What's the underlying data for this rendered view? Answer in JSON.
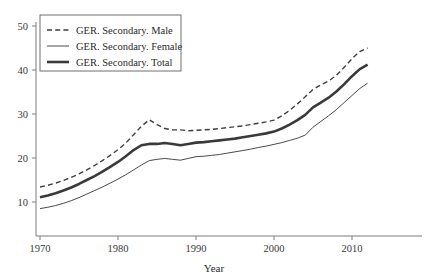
{
  "chart_data": {
    "type": "line",
    "title": "",
    "subtitle": "",
    "xlabel": "Year",
    "ylabel": "",
    "xlim": [
      1970,
      2013
    ],
    "ylim": [
      5,
      52
    ],
    "grid": false,
    "legend_position": "top-left",
    "xticks": [
      1970,
      1980,
      1990,
      2000,
      2010
    ],
    "xtick_labels": [
      "1970",
      "1980",
      "1990",
      "2000",
      "2010"
    ],
    "yticks": [
      10,
      20,
      30,
      40,
      50
    ],
    "ytick_labels": [
      "10",
      "20",
      "30",
      "40",
      "50"
    ],
    "x": [
      1970,
      1971,
      1972,
      1973,
      1974,
      1975,
      1976,
      1977,
      1978,
      1979,
      1980,
      1981,
      1982,
      1983,
      1984,
      1985,
      1986,
      1987,
      1988,
      1989,
      1990,
      1991,
      1992,
      1993,
      1994,
      1995,
      1996,
      1997,
      1998,
      1999,
      2000,
      2001,
      2002,
      2003,
      2004,
      2005,
      2006,
      2007,
      2008,
      2009,
      2010,
      2011,
      2012
    ],
    "series": [
      {
        "name": "GER. Secondary. Male",
        "style": "dashed",
        "color": "#3f3f3f",
        "width": 1.4,
        "values": [
          13.4,
          13.8,
          14.3,
          14.9,
          15.6,
          16.4,
          17.3,
          18.3,
          19.4,
          20.6,
          21.9,
          23.4,
          25.3,
          27.2,
          28.7,
          27.6,
          26.7,
          26.4,
          26.4,
          26.2,
          26.3,
          26.4,
          26.5,
          26.7,
          26.9,
          27.1,
          27.3,
          27.6,
          27.9,
          28.2,
          28.6,
          29.6,
          30.8,
          32.3,
          33.9,
          35.6,
          36.6,
          37.5,
          38.8,
          40.6,
          42.6,
          44.2,
          45.0
        ]
      },
      {
        "name": "GER. Secondary. Female",
        "style": "solid-thin",
        "color": "#4a4a4a",
        "width": 1.0,
        "values": [
          8.5,
          8.8,
          9.2,
          9.7,
          10.3,
          11.0,
          11.8,
          12.6,
          13.4,
          14.3,
          15.2,
          16.2,
          17.3,
          18.4,
          19.4,
          19.7,
          19.9,
          19.7,
          19.5,
          19.9,
          20.3,
          20.4,
          20.6,
          20.8,
          21.1,
          21.4,
          21.7,
          22.0,
          22.4,
          22.7,
          23.1,
          23.5,
          24.0,
          24.5,
          25.2,
          27.0,
          28.3,
          29.6,
          31.0,
          32.6,
          34.2,
          35.8,
          37.0
        ]
      },
      {
        "name": "GER. Secondary. Total",
        "style": "solid-thick",
        "color": "#3a3a3a",
        "width": 2.6,
        "values": [
          11.1,
          11.5,
          12.0,
          12.6,
          13.3,
          14.1,
          15.0,
          15.9,
          16.9,
          18.0,
          19.1,
          20.4,
          21.8,
          22.9,
          23.2,
          23.2,
          23.4,
          23.2,
          22.9,
          23.2,
          23.5,
          23.6,
          23.8,
          24.0,
          24.2,
          24.4,
          24.7,
          25.0,
          25.3,
          25.6,
          26.0,
          26.7,
          27.6,
          28.6,
          29.8,
          31.5,
          32.6,
          33.7,
          35.1,
          36.8,
          38.6,
          40.2,
          41.2
        ]
      }
    ]
  },
  "legend": {
    "entries": [
      {
        "label": "GER. Secondary. Male"
      },
      {
        "label": "GER. Secondary. Female"
      },
      {
        "label": "GER. Secondary. Total"
      }
    ]
  },
  "axes": {
    "x_title": "Year"
  }
}
